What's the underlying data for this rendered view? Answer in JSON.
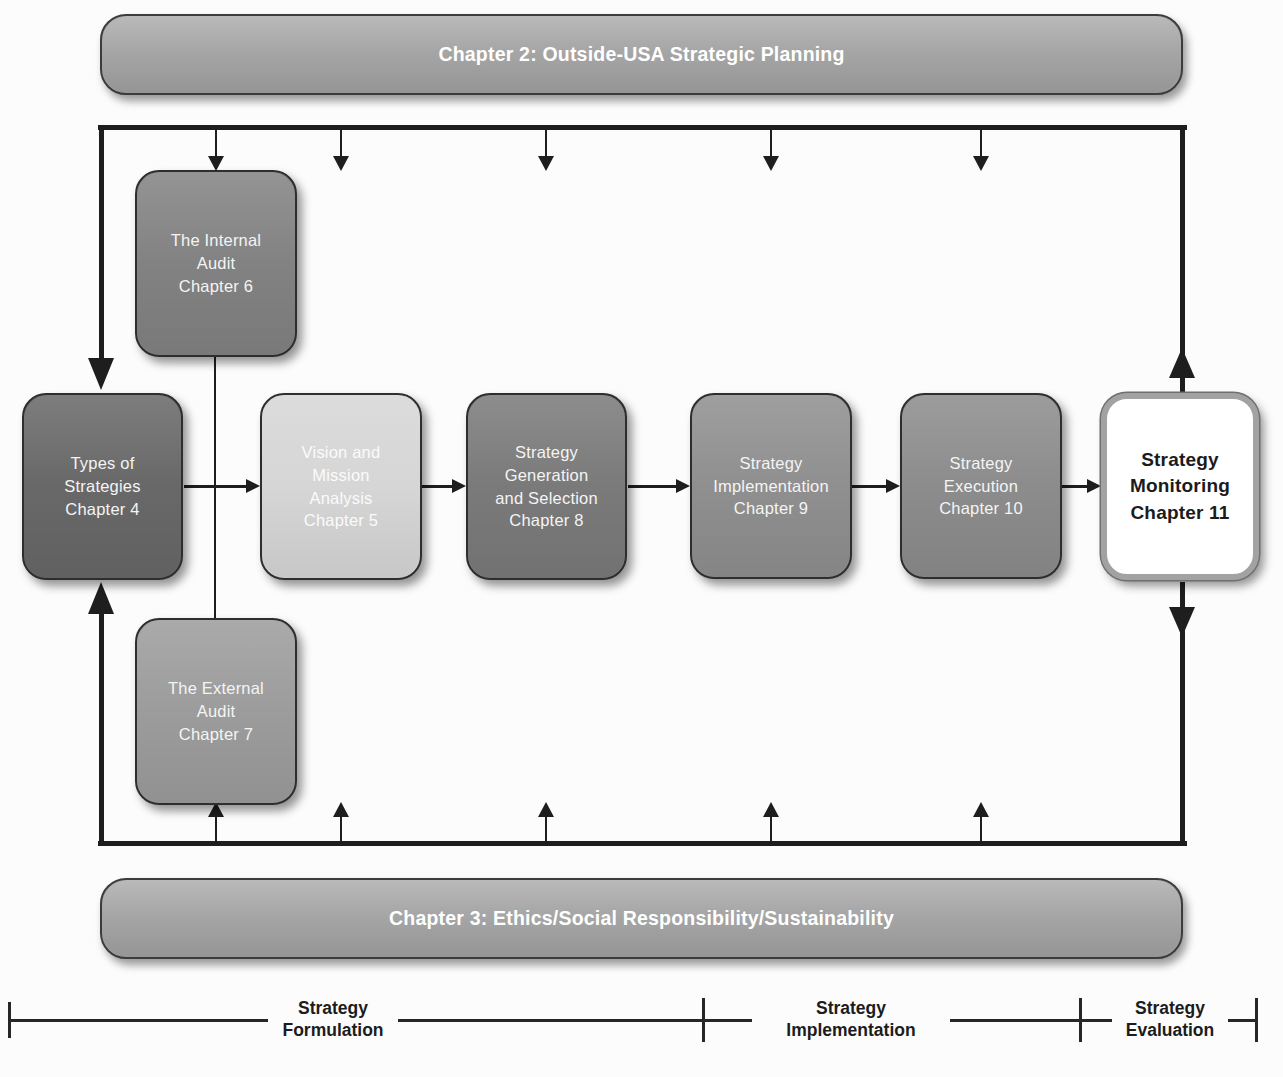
{
  "banners": {
    "top": "Chapter 2: Outside-USA Strategic Planning",
    "bottom": "Chapter 3: Ethics/Social Responsibility/Sustainability"
  },
  "boxes": {
    "internal_audit": {
      "label": "The Internal\nAudit\nChapter 6",
      "fill": "#828282"
    },
    "types": {
      "label": "Types of\nStrategies\nChapter 4",
      "fill": "#686868"
    },
    "vision": {
      "label": "Vision and\nMission\nAnalysis\nChapter 5",
      "fill": "#d6d6d6"
    },
    "generation": {
      "label": "Strategy\nGeneration\nand Selection\nChapter 8",
      "fill": "#7a7a7a"
    },
    "implementation": {
      "label": "Strategy\nImplementation\nChapter 9",
      "fill": "#8f8f8f"
    },
    "execution": {
      "label": "Strategy\nExecution\nChapter 10",
      "fill": "#8c8c8c"
    },
    "monitoring": {
      "label": "Strategy\nMonitoring\nChapter 11",
      "fill": "#ffffff"
    },
    "external_audit": {
      "label": "The External\nAudit\nChapter 7",
      "fill": "#9c9c9c"
    }
  },
  "phases": {
    "formulation": "Strategy\nFormulation",
    "implementation": "Strategy\nImplementation",
    "evaluation": "Strategy\nEvaluation"
  },
  "colors": {
    "banner_fill": "#a6a6a6",
    "loop_line": "#1e1e1e",
    "monitoring_border": "#a2a2a2",
    "bracket_line": "#262626"
  }
}
